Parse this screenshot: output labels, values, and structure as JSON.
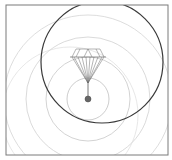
{
  "figure": {
    "colors": {
      "frame": "#7a7a7a",
      "dark_circle": "#3a3a3a",
      "light_circle": "#c8c8c8",
      "diamond": "#6a6a6a",
      "ball": "#666666"
    }
  }
}
